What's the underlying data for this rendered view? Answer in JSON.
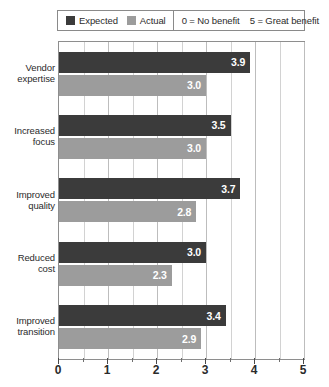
{
  "legend": {
    "items": [
      {
        "label": "Expected",
        "color": "#3b3b3b",
        "swatch_name": "legend-swatch-expected"
      },
      {
        "label": "Actual",
        "color": "#9c9c9c",
        "swatch_name": "legend-swatch-actual"
      }
    ],
    "scale_notes": [
      "0 = No benefit",
      "5 = Great benefit"
    ]
  },
  "chart_data": {
    "type": "bar",
    "orientation": "horizontal",
    "title": "",
    "xlabel": "",
    "ylabel": "",
    "xlim": [
      0,
      5
    ],
    "xticks": [
      0,
      1,
      2,
      3,
      4,
      5
    ],
    "xtick_labels": [
      "0",
      "1",
      "2",
      "3",
      "4",
      "5"
    ],
    "minor_tick_interval": 0.5,
    "grid": true,
    "grid_axis": "x",
    "legend_position": "top",
    "categories": [
      "Vendor expertise",
      "Increased focus",
      "Improved quality",
      "Reduced cost",
      "Improved transition"
    ],
    "category_lines": [
      [
        "Vendor",
        "expertise"
      ],
      [
        "Increased",
        "focus"
      ],
      [
        "Improved",
        "quality"
      ],
      [
        "Reduced",
        "cost"
      ],
      [
        "Improved",
        "transition"
      ]
    ],
    "series": [
      {
        "name": "Expected",
        "color": "#3b3b3b",
        "values": [
          3.9,
          3.5,
          3.7,
          3.0,
          3.4
        ],
        "value_labels": [
          "3.9",
          "3.5",
          "3.7",
          "3.0",
          "3.4"
        ]
      },
      {
        "name": "Actual",
        "color": "#9c9c9c",
        "values": [
          3.0,
          3.0,
          2.8,
          2.3,
          2.9
        ],
        "value_labels": [
          "3.0",
          "3.0",
          "2.8",
          "2.3",
          "2.9"
        ]
      }
    ]
  }
}
